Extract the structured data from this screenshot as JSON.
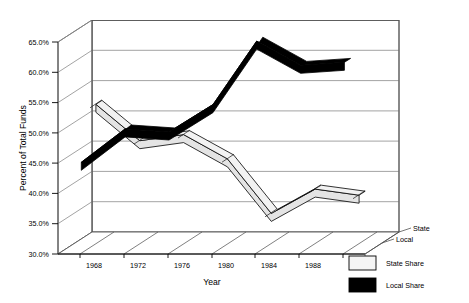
{
  "chart_data": {
    "type": "line",
    "render_style": "3d-ribbon",
    "title": "",
    "xlabel": "Year",
    "ylabel": "Percent of Total Funds",
    "zlabel": "",
    "categories": [
      1968,
      1972,
      1976,
      1980,
      1984,
      1988,
      1992
    ],
    "x": [
      "1968",
      "1972",
      "1976",
      "1980",
      "1984",
      "1988",
      "1992"
    ],
    "ylim": [
      30.0,
      65.0
    ],
    "ytick_values": [
      30.0,
      35.0,
      40.0,
      45.0,
      50.0,
      55.0,
      60.0,
      65.0
    ],
    "ytick_labels": [
      "30.0%",
      "35.0%",
      "40.0%",
      "45.0%",
      "50.0%",
      "55.0%",
      "60.0%",
      "65.0%"
    ],
    "grid": true,
    "legend_position": "bottom-right",
    "depth_axis": {
      "labels": [
        "State",
        "Local"
      ],
      "order": [
        "State",
        "Local"
      ]
    },
    "series": [
      {
        "name": "State Share",
        "depth_label": "State",
        "color": "#f2f2f2",
        "edge_color": "#000000",
        "values": [
          53.0,
          47.0,
          48.0,
          44.0,
          35.0,
          39.0,
          38.0
        ]
      },
      {
        "name": "Local Share",
        "depth_label": "Local",
        "color": "#000000",
        "edge_color": "#000000",
        "values": [
          45.0,
          50.5,
          50.0,
          54.5,
          65.0,
          61.0,
          61.5
        ]
      }
    ]
  },
  "axes": {
    "y_title": "Percent of Total Funds",
    "x_title": "Year",
    "y_ticks": [
      "65.0%",
      "60.0%",
      "55.0%",
      "50.0%",
      "45.0%",
      "40.0%",
      "35.0%",
      "30.0%"
    ],
    "x_ticks": [
      "1968",
      "1972",
      "1976",
      "1980",
      "1984",
      "1988",
      "1992"
    ],
    "depth_ticks": [
      "State",
      "Local"
    ]
  },
  "legend": {
    "items": [
      {
        "label": "State Share",
        "swatch": "#f2f2f2"
      },
      {
        "label": "Local Share",
        "swatch": "#000000"
      }
    ]
  },
  "colors": {
    "state_share": "#f2f2f2",
    "local_share": "#000000",
    "grid": "#8c8c8c",
    "frame": "#555555",
    "background": "#ffffff"
  }
}
